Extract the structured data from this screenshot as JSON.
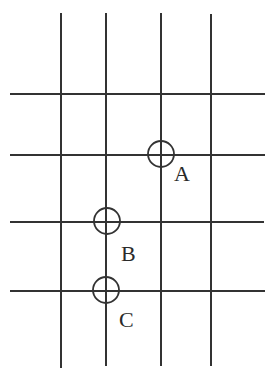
{
  "diagram": {
    "type": "grid-with-marked-points",
    "stroke_color": "#333333",
    "vertical_lines": [
      {
        "x": 61,
        "y1": 13,
        "y2": 368
      },
      {
        "x": 106,
        "y1": 13,
        "y2": 366
      },
      {
        "x": 161,
        "y1": 13,
        "y2": 366
      },
      {
        "x": 211,
        "y1": 14,
        "y2": 366
      }
    ],
    "horizontal_lines": [
      {
        "y": 94,
        "x1": 10,
        "x2": 265
      },
      {
        "y": 155,
        "x1": 10,
        "x2": 265
      },
      {
        "y": 222,
        "x1": 10,
        "x2": 264
      },
      {
        "y": 291,
        "x1": 10,
        "x2": 265
      }
    ],
    "points": [
      {
        "name": "A",
        "label": "A",
        "cx": 161,
        "cy": 154,
        "r": 13,
        "label_x": 174,
        "label_y": 181
      },
      {
        "name": "B",
        "label": "B",
        "cx": 107,
        "cy": 221,
        "r": 13,
        "label_x": 121,
        "label_y": 261
      },
      {
        "name": "C",
        "label": "C",
        "cx": 106,
        "cy": 290,
        "r": 13,
        "label_x": 119,
        "label_y": 327
      }
    ]
  }
}
